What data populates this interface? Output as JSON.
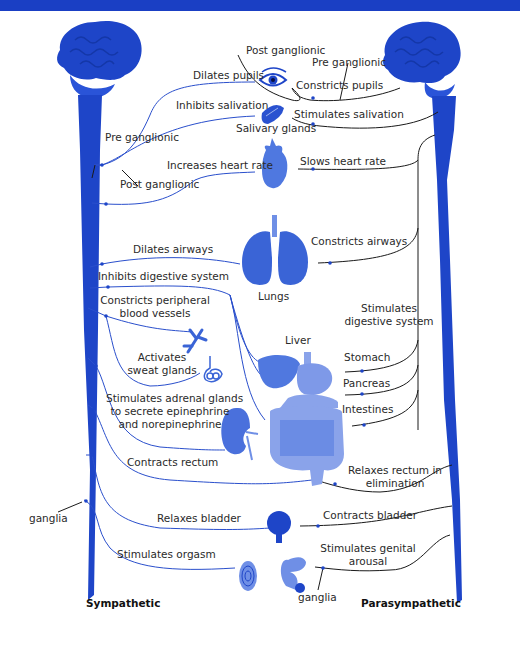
{
  "header": {
    "text": ""
  },
  "colors": {
    "sympathetic": "#1e45c8",
    "parasympathetic": "#1a1a1a",
    "organ": "#3a64d6",
    "accent": "#1a3fc4"
  },
  "labels": {
    "post_ganglionic_top": "Post ganglionic",
    "pre_ganglionic_top": "Pre ganglionic",
    "dilates_pupils": "Dilates pupils",
    "constricts_pupils": "Constricts pupils",
    "inhibits_salivation": "Inhibits salivation",
    "stimulates_salivation": "Stimulates salivation",
    "salivary_glands": "Salivary glands",
    "pre_ganglionic_left": "Pre ganglionic",
    "post_ganglionic_left": "Post ganglionic",
    "increases_heart_rate": "Increases heart rate",
    "slows_heart_rate": "Slows heart rate",
    "dilates_airways": "Dilates airways",
    "constricts_airways": "Constricts airways",
    "lungs": "Lungs",
    "inhibits_digestive": "Inhibits digestive system",
    "stimulates_digestive_1": "Stimulates",
    "stimulates_digestive_2": "digestive system",
    "constricts_vessels_1": "Constricts peripheral",
    "constricts_vessels_2": "blood vessels",
    "liver": "Liver",
    "stomach": "Stomach",
    "pancreas": "Pancreas",
    "intestines": "Intestines",
    "activates_sweat_1": "Activates",
    "activates_sweat_2": "sweat glands",
    "adrenal_1": "Stimulates adrenal glands",
    "adrenal_2": "to secrete epinephrine",
    "adrenal_3": "and norepinephrine",
    "contracts_rectum": "Contracts rectum",
    "relaxes_rectum_1": "Relaxes rectum in",
    "relaxes_rectum_2": "elimination",
    "ganglia_left": "ganglia",
    "relaxes_bladder": "Relaxes bladder",
    "contracts_bladder": "Contracts bladder",
    "stimulates_orgasm": "Stimulates orgasm",
    "genital_1": "Stimulates genital",
    "genital_2": "arousal",
    "ganglia_right": "ganglia",
    "sympathetic": "Sympathetic",
    "parasympathetic": "Parasympathetic"
  }
}
